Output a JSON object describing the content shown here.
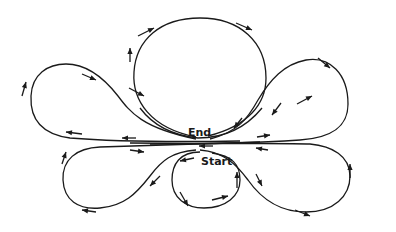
{
  "diagram": {
    "type": "path-loop-diagram",
    "labels": {
      "start": "Start",
      "end": "End"
    },
    "colors": {
      "stroke": "#1a1a1a",
      "background": "#ffffff"
    },
    "loops": [
      {
        "id": "bottom-small-loop",
        "direction": "counterclockwise"
      },
      {
        "id": "lower-left-petal",
        "direction": "clockwise"
      },
      {
        "id": "lower-right-petal",
        "direction": "counterclockwise"
      },
      {
        "id": "top-circle",
        "direction": "clockwise"
      },
      {
        "id": "upper-right-petal",
        "direction": "counterclockwise"
      },
      {
        "id": "upper-left-petal",
        "direction": "clockwise"
      }
    ],
    "arrow_count": 22
  }
}
